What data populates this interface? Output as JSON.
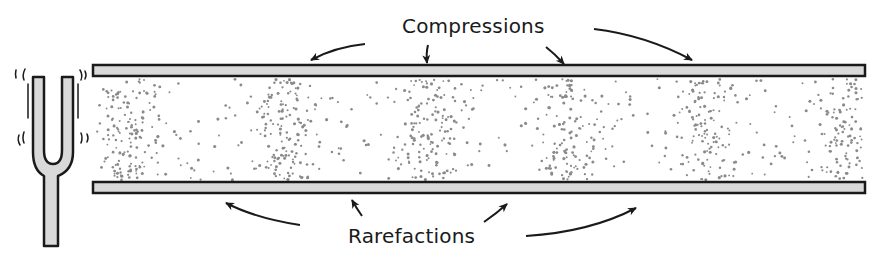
{
  "diagram": {
    "type": "sound-wave-in-tube",
    "labels": {
      "compressions": "Compressions",
      "rarefactions": "Rarefactions"
    },
    "source": "tuning-fork",
    "colors": {
      "outline": "#1a1a1a",
      "wall_fill": "#d9d9d9",
      "particle": "#8a8a8a",
      "background": "#ffffff"
    },
    "compression_centers_x": [
      130,
      285,
      430,
      570,
      705,
      850
    ],
    "rarefaction_centers_x": [
      210,
      355,
      500,
      640,
      780
    ]
  }
}
